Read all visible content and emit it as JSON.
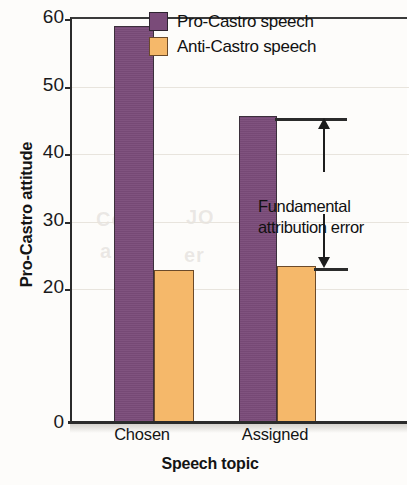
{
  "chart_data": {
    "type": "bar",
    "title": "",
    "xlabel": "Speech topic",
    "ylabel": "Pro-Castro attitude",
    "categories": [
      "Chosen",
      "Assigned"
    ],
    "series": [
      {
        "name": "Pro-Castro speech",
        "color": "#7a4b79",
        "values": [
          58.7,
          45.3
        ]
      },
      {
        "name": "Anti-Castro speech",
        "color": "#f5b86a",
        "values": [
          22.5,
          23.1
        ]
      }
    ],
    "ylim": [
      0,
      60
    ],
    "yticks": [
      0,
      20,
      30,
      40,
      50,
      60
    ],
    "ytick_labels": [
      "0",
      "20",
      "30",
      "40",
      "50",
      "60"
    ],
    "grid": true,
    "legend_position": "top-right",
    "annotations": [
      {
        "text_lines": [
          "Fundamental",
          "attribution error"
        ],
        "type": "double-headed-arrow",
        "from_value": 45.3,
        "to_value": 23.1
      }
    ]
  },
  "axes": {
    "y_title": "Pro-Castro attitude",
    "x_title": "Speech topic",
    "y_tick_labels": [
      "60",
      "50",
      "40",
      "30",
      "20",
      "0"
    ],
    "x_tick_labels": [
      "Chosen",
      "Assigned"
    ]
  },
  "legend": {
    "items": [
      {
        "label": "Pro-Castro speech",
        "color": "#7a4b79",
        "swatch": "purple-swatch"
      },
      {
        "label": "Anti-Castro speech",
        "color": "#f5b86a",
        "swatch": "orange-swatch"
      }
    ]
  },
  "annotation": {
    "line1": "Fundamental",
    "line2": "attribution error"
  },
  "colors": {
    "pro_castro": "#7a4b79",
    "anti_castro": "#f5b86a",
    "axis": "#2b2b2b",
    "grid": "#e8e4dd",
    "text": "#111111"
  }
}
